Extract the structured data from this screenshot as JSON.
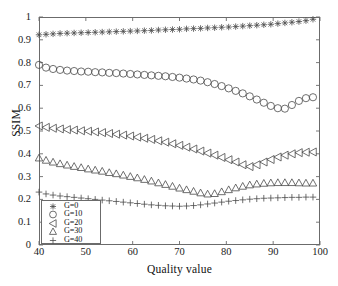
{
  "chart_data": {
    "type": "scatter",
    "title": "",
    "xlabel": "Quality value",
    "ylabel": "SSIM",
    "xlim": [
      40,
      100
    ],
    "ylim": [
      0,
      1
    ],
    "xticks": [
      40,
      50,
      60,
      70,
      80,
      90,
      100
    ],
    "yticks": [
      0,
      0.1,
      0.2,
      0.3,
      0.4,
      0.5,
      0.6,
      0.7,
      0.8,
      0.9,
      1
    ],
    "grid": false,
    "legend_position": "lower left",
    "marker_only": true,
    "x": [
      40,
      41.5,
      43,
      44.5,
      46,
      47.5,
      49,
      50.5,
      52,
      53.5,
      55,
      56.5,
      58,
      59.5,
      61,
      62.5,
      64,
      65.5,
      67,
      68.5,
      70,
      71.5,
      73,
      74.5,
      76,
      77.5,
      79,
      80.5,
      82,
      83.5,
      85,
      86.5,
      88,
      89.5,
      91,
      92.5,
      94,
      95.5,
      97,
      98.5
    ],
    "series": [
      {
        "name": "G=0",
        "marker": "asterisk",
        "values": [
          0.922,
          0.924,
          0.926,
          0.928,
          0.929,
          0.93,
          0.931,
          0.932,
          0.933,
          0.934,
          0.935,
          0.936,
          0.937,
          0.938,
          0.939,
          0.94,
          0.941,
          0.943,
          0.944,
          0.945,
          0.946,
          0.948,
          0.949,
          0.95,
          0.952,
          0.953,
          0.955,
          0.956,
          0.958,
          0.96,
          0.962,
          0.964,
          0.966,
          0.968,
          0.971,
          0.974,
          0.977,
          0.98,
          0.984,
          0.99
        ]
      },
      {
        "name": "G=10",
        "marker": "circle",
        "values": [
          0.79,
          0.778,
          0.772,
          0.768,
          0.765,
          0.763,
          0.761,
          0.76,
          0.758,
          0.757,
          0.755,
          0.754,
          0.752,
          0.75,
          0.748,
          0.746,
          0.744,
          0.742,
          0.74,
          0.737,
          0.734,
          0.73,
          0.726,
          0.721,
          0.714,
          0.706,
          0.697,
          0.687,
          0.676,
          0.665,
          0.652,
          0.638,
          0.624,
          0.61,
          0.6,
          0.598,
          0.614,
          0.632,
          0.644,
          0.648
        ]
      },
      {
        "name": "G=20",
        "marker": "left-triangle",
        "values": [
          0.522,
          0.516,
          0.512,
          0.509,
          0.506,
          0.504,
          0.501,
          0.499,
          0.496,
          0.493,
          0.489,
          0.486,
          0.482,
          0.478,
          0.473,
          0.468,
          0.463,
          0.457,
          0.451,
          0.444,
          0.437,
          0.429,
          0.421,
          0.412,
          0.403,
          0.394,
          0.384,
          0.374,
          0.364,
          0.352,
          0.344,
          0.352,
          0.364,
          0.375,
          0.386,
          0.394,
          0.4,
          0.405,
          0.407,
          0.408
        ]
      },
      {
        "name": "G=30",
        "marker": "up-triangle",
        "values": [
          0.382,
          0.372,
          0.364,
          0.357,
          0.351,
          0.345,
          0.34,
          0.334,
          0.329,
          0.324,
          0.318,
          0.313,
          0.307,
          0.301,
          0.295,
          0.288,
          0.281,
          0.273,
          0.266,
          0.258,
          0.25,
          0.243,
          0.236,
          0.229,
          0.224,
          0.226,
          0.234,
          0.243,
          0.251,
          0.258,
          0.264,
          0.268,
          0.271,
          0.273,
          0.274,
          0.274,
          0.274,
          0.273,
          0.272,
          0.272
        ]
      },
      {
        "name": "G=40",
        "marker": "plus",
        "values": [
          0.232,
          0.224,
          0.219,
          0.215,
          0.212,
          0.209,
          0.206,
          0.203,
          0.2,
          0.197,
          0.194,
          0.191,
          0.188,
          0.185,
          0.182,
          0.179,
          0.176,
          0.174,
          0.172,
          0.171,
          0.17,
          0.171,
          0.173,
          0.176,
          0.18,
          0.184,
          0.188,
          0.192,
          0.195,
          0.198,
          0.201,
          0.203,
          0.205,
          0.206,
          0.207,
          0.208,
          0.209,
          0.209,
          0.21,
          0.21
        ]
      }
    ]
  },
  "axes": {
    "ylabel": "SSIM",
    "xlabel": "Quality value",
    "xticklabels": [
      "40",
      "50",
      "60",
      "70",
      "80",
      "90",
      "100"
    ],
    "yticklabels": [
      "0",
      "0.1",
      "0.2",
      "0.3",
      "0.4",
      "0.5",
      "0.6",
      "0.7",
      "0.8",
      "0.9",
      "1"
    ]
  },
  "legend": {
    "entries": [
      {
        "label": "G=0",
        "marker": "asterisk"
      },
      {
        "label": "G=10",
        "marker": "circle"
      },
      {
        "label": "G=20",
        "marker": "left-triangle"
      },
      {
        "label": "G=30",
        "marker": "up-triangle"
      },
      {
        "label": "G=40",
        "marker": "plus"
      }
    ]
  },
  "colors": {
    "marker": "#4a4a4a",
    "axis": "#6b6b6b",
    "text": "#111111",
    "background": "#ffffff"
  }
}
